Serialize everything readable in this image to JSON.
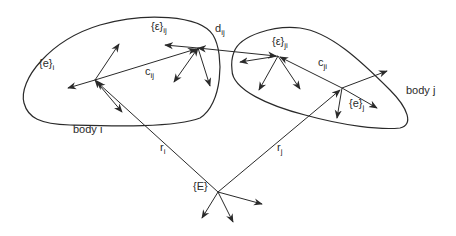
{
  "diagram": {
    "type": "multibody-coordinate-frames",
    "bodies": [
      {
        "id": "body_i",
        "label": "body i"
      },
      {
        "id": "body_j",
        "label": "body j"
      }
    ],
    "labels": {
      "frame_e_i": {
        "base": "{e}",
        "sub": "i"
      },
      "frame_e_j": {
        "base": "{e}",
        "sub": "j"
      },
      "frame_eps_ij": {
        "base": "{ε}",
        "sub": "ij"
      },
      "frame_eps_ji": {
        "base": "{ε}",
        "sub": "ji"
      },
      "frame_E": {
        "base": "{E}"
      },
      "vec_c_ij": {
        "base": "c",
        "sub": "ij"
      },
      "vec_c_ji": {
        "base": "c",
        "sub": "ji"
      },
      "vec_d_ij": {
        "base": "d",
        "sub": "ij"
      },
      "vec_r_i": {
        "base": "r",
        "sub": "i"
      },
      "vec_r_j": {
        "base": "r",
        "sub": "j"
      }
    },
    "colors": {
      "stroke": "#2a2a2a",
      "background": "#ffffff"
    }
  }
}
